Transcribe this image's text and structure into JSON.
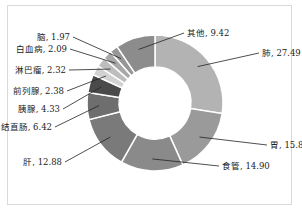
{
  "chart_data": {
    "type": "pie",
    "subtype": "donut",
    "title": "",
    "unit": "%",
    "start": "top",
    "direction": "clockwise",
    "slices": [
      {
        "label": "肺",
        "value": 27.49,
        "color": "#b3b3b3",
        "text": "肺, 27.49"
      },
      {
        "label": "胃",
        "value": 15.8,
        "color": "#9a9a9a",
        "text": "胃, 15.80"
      },
      {
        "label": "食管",
        "value": 14.9,
        "color": "#8a8a8a",
        "text": "食管, 14.90"
      },
      {
        "label": "肝",
        "value": 12.88,
        "color": "#7a7a7a",
        "text": "肝, 12.88"
      },
      {
        "label": "结直肠",
        "value": 6.42,
        "color": "#6e6e6e",
        "text": "结直肠, 6.42"
      },
      {
        "label": "胰腺",
        "value": 4.33,
        "color": "#4a4a4a",
        "text": "胰腺, 4.33"
      },
      {
        "label": "前列腺",
        "value": 2.38,
        "color": "#d2d2d2",
        "text": "前列腺, 2.38"
      },
      {
        "label": "淋巴瘤",
        "value": 2.32,
        "color": "#bdbdbd",
        "text": "淋巴瘤, 2.32"
      },
      {
        "label": "白血病",
        "value": 2.09,
        "color": "#a8a8a8",
        "text": "白血病, 2.09"
      },
      {
        "label": "脑",
        "value": 1.97,
        "color": "#979797",
        "text": "脑, 1.97"
      },
      {
        "label": "其他",
        "value": 9.42,
        "color": "#8c8c8c",
        "text": "其他, 9.42"
      }
    ],
    "legend": "none",
    "data_labels": "outside with leader lines"
  }
}
